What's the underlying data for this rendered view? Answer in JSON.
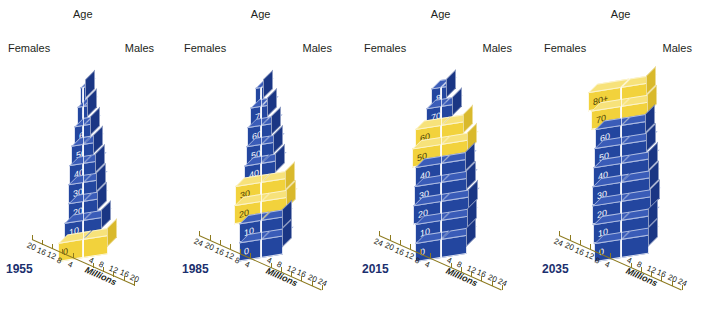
{
  "figure": {
    "age_axis_label": "Age",
    "females_label": "Females",
    "males_label": "Males",
    "unit_label": "Millions",
    "credit": "Compiled by the authors using data from U.S. Census Bureau and Population Reference Bureau.",
    "colors": {
      "blue": "#23469f",
      "blue_top": "#3a5cb8",
      "blue_side": "#1a3684",
      "gold": "#f2d23c",
      "gold_top": "#f7e27a",
      "gold_side": "#d9b92c",
      "text": "#231f20",
      "year": "#1b2f6e",
      "background": "#ffffff"
    }
  },
  "chart_data": {
    "type": "bar",
    "subtitle": "Baby boom cohort highlighted in gold",
    "xlabel": "Millions",
    "ylabel": "Age",
    "grid": false,
    "legend": "none",
    "age_groups": [
      "0",
      "10",
      "20",
      "30",
      "40",
      "50",
      "60",
      "70",
      "80+"
    ],
    "panels": [
      {
        "year": "1955",
        "axis_max": 20,
        "axis_ticks": [
          20,
          16,
          12,
          8,
          4,
          4,
          8,
          12,
          16,
          20
        ],
        "axis_labels_left": [
          "20",
          "16",
          "12",
          "8",
          "4"
        ],
        "axis_labels_right": [
          "4",
          "8",
          "12",
          "16",
          "20"
        ],
        "rows": [
          {
            "age": "0",
            "females": 9.5,
            "males": 9.9,
            "highlight": true
          },
          {
            "age": "10",
            "females": 7.4,
            "males": 7.6,
            "highlight": false
          },
          {
            "age": "20",
            "females": 5.9,
            "males": 5.8,
            "highlight": false
          },
          {
            "age": "30",
            "females": 5.8,
            "males": 5.7,
            "highlight": false
          },
          {
            "age": "40",
            "females": 5.4,
            "males": 5.3,
            "highlight": false
          },
          {
            "age": "50",
            "females": 4.5,
            "males": 4.4,
            "highlight": false
          },
          {
            "age": "60",
            "females": 3.5,
            "males": 3.3,
            "highlight": false
          },
          {
            "age": "70",
            "females": 2.3,
            "males": 2.0,
            "highlight": false
          },
          {
            "age": "80+",
            "females": 1.0,
            "males": 0.8,
            "highlight": false
          }
        ]
      },
      {
        "year": "1985",
        "axis_max": 24,
        "axis_ticks": [
          24,
          20,
          16,
          12,
          8,
          4,
          4,
          8,
          12,
          16,
          20,
          24
        ],
        "axis_labels_left": [
          "24",
          "20",
          "16",
          "12",
          "8",
          "4"
        ],
        "axis_labels_right": [
          "4",
          "8",
          "12",
          "16",
          "20",
          "24"
        ],
        "rows": [
          {
            "age": "0",
            "females": 8.5,
            "males": 8.9,
            "highlight": false
          },
          {
            "age": "10",
            "females": 8.4,
            "males": 8.8,
            "highlight": false
          },
          {
            "age": "20",
            "females": 10.4,
            "males": 10.5,
            "highlight": true
          },
          {
            "age": "30",
            "females": 10.0,
            "males": 9.9,
            "highlight": true
          },
          {
            "age": "40",
            "females": 6.4,
            "males": 6.2,
            "highlight": false
          },
          {
            "age": "50",
            "females": 5.7,
            "males": 5.4,
            "highlight": false
          },
          {
            "age": "60",
            "females": 5.3,
            "males": 4.6,
            "highlight": false
          },
          {
            "age": "70",
            "females": 4.1,
            "males": 3.1,
            "highlight": false
          },
          {
            "age": "80+",
            "females": 2.2,
            "males": 1.2,
            "highlight": false
          }
        ]
      },
      {
        "year": "2015",
        "axis_max": 24,
        "axis_ticks": [
          24,
          20,
          16,
          12,
          8,
          4,
          4,
          8,
          12,
          16,
          20,
          24
        ],
        "axis_labels_left": [
          "24",
          "20",
          "16",
          "12",
          "8",
          "4"
        ],
        "axis_labels_right": [
          "4",
          "8",
          "12",
          "16",
          "20",
          "24"
        ],
        "rows": [
          {
            "age": "0",
            "females": 9.9,
            "males": 10.3,
            "highlight": false
          },
          {
            "age": "10",
            "females": 10.2,
            "males": 10.7,
            "highlight": false
          },
          {
            "age": "20",
            "females": 10.8,
            "males": 11.3,
            "highlight": false
          },
          {
            "age": "30",
            "females": 10.4,
            "males": 10.5,
            "highlight": false
          },
          {
            "age": "40",
            "females": 10.2,
            "males": 10.1,
            "highlight": false
          },
          {
            "age": "50",
            "females": 11.3,
            "males": 10.9,
            "highlight": true
          },
          {
            "age": "60",
            "females": 10.0,
            "males": 9.2,
            "highlight": true
          },
          {
            "age": "70",
            "females": 5.8,
            "males": 4.8,
            "highlight": false
          },
          {
            "age": "80+",
            "females": 3.7,
            "males": 2.4,
            "highlight": false
          }
        ]
      },
      {
        "year": "2035",
        "axis_max": 24,
        "axis_ticks": [
          24,
          20,
          16,
          12,
          8,
          4,
          4,
          8,
          12,
          16,
          20,
          24
        ],
        "axis_labels_left": [
          "24",
          "20",
          "16",
          "12",
          "8",
          "4"
        ],
        "axis_labels_right": [
          "4",
          "8",
          "12",
          "16",
          "20",
          "24"
        ],
        "rows": [
          {
            "age": "0",
            "females": 10.6,
            "males": 11.1,
            "highlight": false
          },
          {
            "age": "10",
            "females": 10.8,
            "males": 11.3,
            "highlight": false
          },
          {
            "age": "20",
            "females": 11.3,
            "males": 11.8,
            "highlight": false
          },
          {
            "age": "30",
            "females": 11.1,
            "males": 11.4,
            "highlight": false
          },
          {
            "age": "40",
            "females": 11.0,
            "males": 11.2,
            "highlight": false
          },
          {
            "age": "50",
            "females": 10.5,
            "males": 10.5,
            "highlight": false
          },
          {
            "age": "60",
            "females": 10.2,
            "males": 9.9,
            "highlight": false
          },
          {
            "age": "70",
            "females": 11.8,
            "males": 10.6,
            "highlight": true
          },
          {
            "age": "80+",
            "females": 12.6,
            "males": 10.2,
            "highlight": true
          }
        ]
      }
    ]
  }
}
